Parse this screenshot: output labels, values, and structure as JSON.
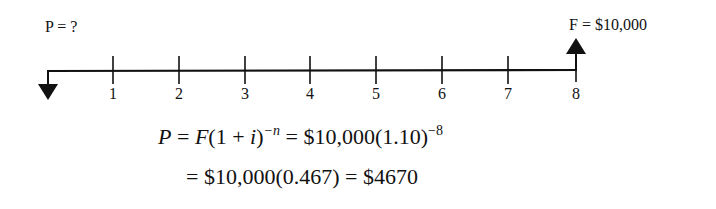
{
  "diagram": {
    "type": "cash-flow-timeline",
    "present_label": "P = ?",
    "future_label": "F = $10,000",
    "periods": [
      "1",
      "2",
      "3",
      "4",
      "5",
      "6",
      "7",
      "8"
    ],
    "tick_x": [
      113,
      179,
      245,
      310,
      376,
      442,
      508,
      576
    ]
  },
  "equations": {
    "line1": {
      "lhs": "P",
      "eq1": " = ",
      "F": "F",
      "paren_open": "(1 + ",
      "i": "i",
      "paren_close": ")",
      "exp_n": "−n",
      "eq2": " = $10,000(1.10)",
      "exp_8": "−8"
    },
    "line2": "= $10,000(0.467) = $4670"
  }
}
